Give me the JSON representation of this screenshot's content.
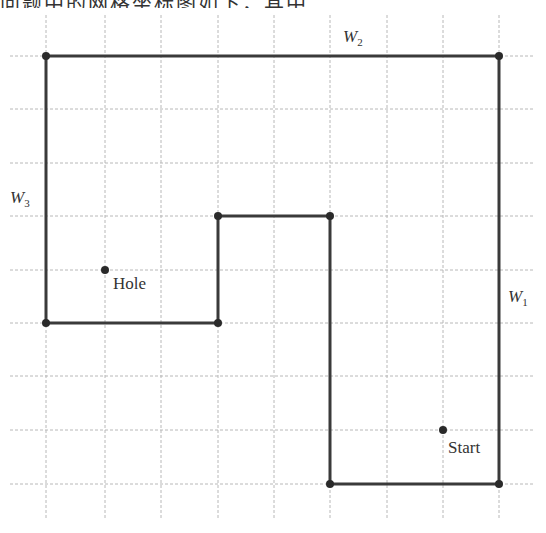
{
  "header": {
    "cropped_text": "问题中的网格坐标图如下，其中"
  },
  "diagram": {
    "type": "grid-maze",
    "grid": {
      "x_lines": [
        46,
        105,
        161,
        218,
        274,
        330,
        387,
        443,
        499
      ],
      "y_lines": [
        56,
        109,
        163,
        216,
        270,
        323,
        376,
        430,
        484
      ],
      "x_extent": [
        10,
        535
      ],
      "y_extent": [
        15,
        520
      ]
    },
    "walls": [
      {
        "id": "W2",
        "label": "W",
        "sub": "2",
        "label_pos": [
          343,
          42
        ]
      },
      {
        "id": "W3",
        "label": "W",
        "sub": "3",
        "label_pos": [
          10,
          203
        ]
      },
      {
        "id": "W1",
        "label": "W",
        "sub": "1",
        "label_pos": [
          508,
          302
        ]
      }
    ],
    "path_points": "46,56 499,56 499,484 330,484 330,216 218,216 218,323 46,323 46,56",
    "vertices": [
      [
        46,
        56
      ],
      [
        499,
        56
      ],
      [
        499,
        484
      ],
      [
        330,
        484
      ],
      [
        330,
        216
      ],
      [
        218,
        216
      ],
      [
        218,
        323
      ],
      [
        46,
        323
      ]
    ],
    "points": [
      {
        "name": "Hole",
        "x": 105,
        "y": 270,
        "label_x": 113,
        "label_y": 289
      },
      {
        "name": "Start",
        "x": 443,
        "y": 430,
        "label_x": 448,
        "label_y": 453
      }
    ]
  }
}
